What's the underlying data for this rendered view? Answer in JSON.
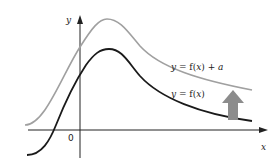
{
  "diagram": {
    "axes": {
      "x_label": "x",
      "y_label": "y",
      "origin_label": "0"
    },
    "curves": [
      {
        "name": "f",
        "label_prefix": "y = f(",
        "label_var": "x",
        "label_suffix": ")",
        "color": "#1a1a1a"
      },
      {
        "name": "f_plus_a",
        "label_prefix": "y = f(",
        "label_var": "x",
        "label_suffix": ") + ",
        "label_param": "a",
        "color": "#a0a0a0"
      }
    ],
    "translation_arrow": {
      "direction": "up",
      "color": "#8c8c8c"
    }
  }
}
